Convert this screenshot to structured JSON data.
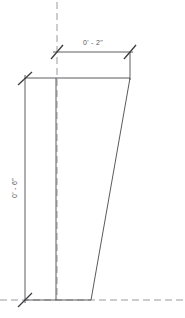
{
  "drawing": {
    "title": "Tapered Element Elevation",
    "background_color": "#ffffff",
    "line_color": "#6e6e72",
    "shape_line_color": "#5a5a5e",
    "dim_line_color": "#4d4d50",
    "centerline_color": "#9a9a9e",
    "text_color": "#58585a",
    "width": 185,
    "height": 318
  },
  "dimensions": {
    "horizontal": {
      "label": "0' - 2\"",
      "orientation": "horizontal",
      "position": "top",
      "value_feet": 0,
      "value_inches": 2
    },
    "vertical": {
      "label": "0' - 6\"",
      "orientation": "vertical-rotated",
      "position": "left",
      "value_feet": 0,
      "value_inches": 6
    }
  },
  "geometry": {
    "shape": {
      "name": "tapered-profile",
      "points": "56,78 130,78 91,300 56,300",
      "top_width_px": 74,
      "bottom_width_px": 35,
      "height_px": 222
    },
    "centerline_vertical": {
      "x": 57,
      "y1": 0,
      "y2": 300
    },
    "centerline_horizontal": {
      "y": 300,
      "x1": 0,
      "x2": 185
    }
  }
}
